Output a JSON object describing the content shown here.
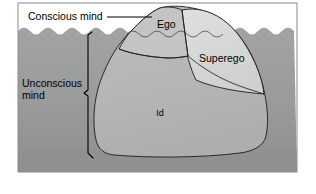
{
  "diagram": {
    "labels": {
      "conscious_mind": "Conscious mind",
      "unconscious_mind_line1": "Unconscious",
      "unconscious_mind_line2": "mind",
      "ego": "Ego",
      "superego": "Superego",
      "id": "Id"
    },
    "colors": {
      "page_background": "#ffffff",
      "sky": "#ffffff",
      "water": "#9a9b9b",
      "water_deep": "#8e8f8f",
      "iceberg_body": "#b5b6b6",
      "iceberg_peak": "#b9baba",
      "superego_wedge": "#d6d7d7",
      "ego_face": "#c2c3c3",
      "outline": "#1c1c1c",
      "frame_border": "#8b8c8c",
      "text": "#000000"
    },
    "regions": [
      {
        "name": "ego",
        "label": "Ego",
        "position": "iceberg peak, above and just below waterline"
      },
      {
        "name": "superego",
        "label": "Superego",
        "position": "right flank wedge, straddling waterline"
      },
      {
        "name": "id",
        "label": "Id",
        "position": "large submerged body"
      }
    ],
    "annotations": [
      {
        "name": "conscious-mind",
        "label": "Conscious mind",
        "connector": "horizontal leader line to iceberg peak above water"
      },
      {
        "name": "unconscious-mind",
        "label": "Unconscious mind",
        "connector": "vertical bracket spanning from waterline to iceberg base"
      }
    ]
  }
}
